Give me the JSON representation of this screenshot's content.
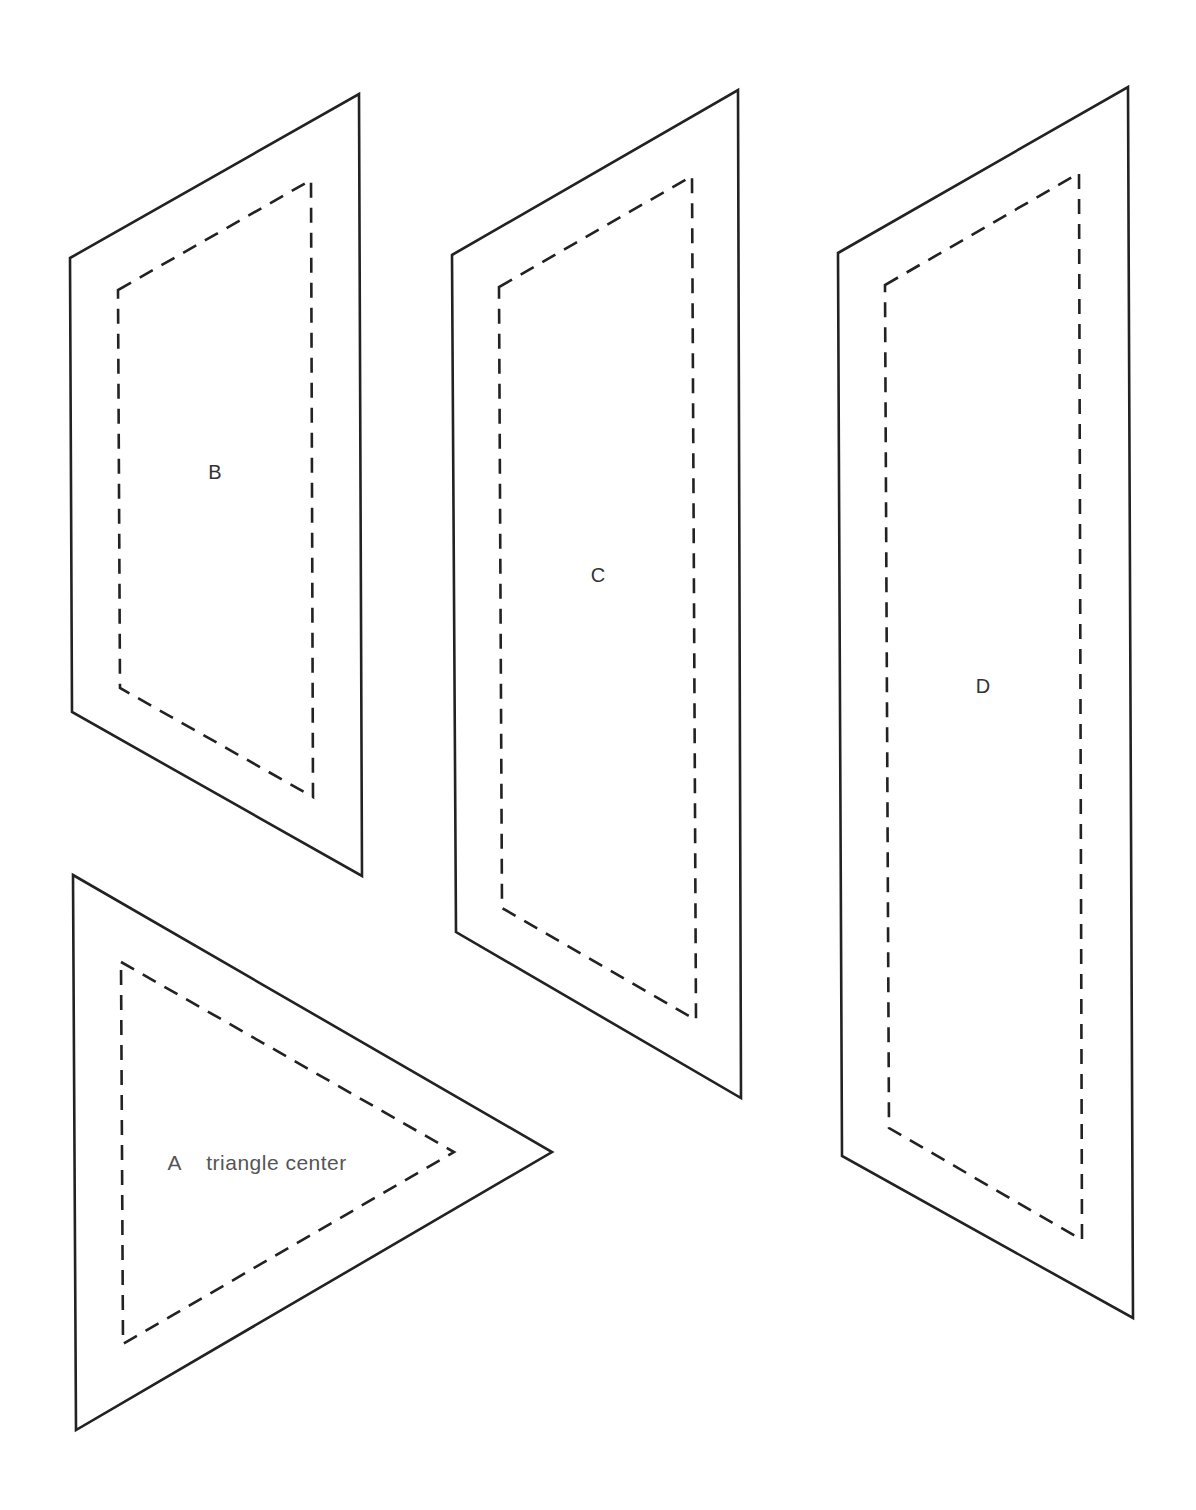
{
  "diagram": {
    "title": "",
    "colors": {
      "line": "#222222",
      "background": "#ffffff",
      "label": "#333333"
    },
    "shapes": [
      {
        "id": "A",
        "label": "A",
        "annotation": "triangle center",
        "type": "triangle",
        "outer": "73,875 552,1152 76,1430",
        "inner": "121,962 454,1152 123,1344",
        "label_pos": {
          "x": 156,
          "y": 1153
        }
      },
      {
        "id": "B",
        "label": "B",
        "type": "parallelogram",
        "outer": "70,258 359,94 362,876 72,712",
        "inner": "118,290 311,180 313,797 120,688",
        "label_pos": {
          "x": 215,
          "y": 472
        }
      },
      {
        "id": "C",
        "label": "C",
        "type": "parallelogram",
        "outer": "452,255 738,90 741,1098 456,932",
        "inner": "499,287 692,176 696,1020 502,908",
        "label_pos": {
          "x": 598,
          "y": 575
        }
      },
      {
        "id": "D",
        "label": "D",
        "type": "parallelogram",
        "outer": "838,253 1128,87 1133,1318 842,1156",
        "inner": "885,285 1079,173 1082,1240 889,1128",
        "label_pos": {
          "x": 983,
          "y": 686
        }
      }
    ]
  }
}
